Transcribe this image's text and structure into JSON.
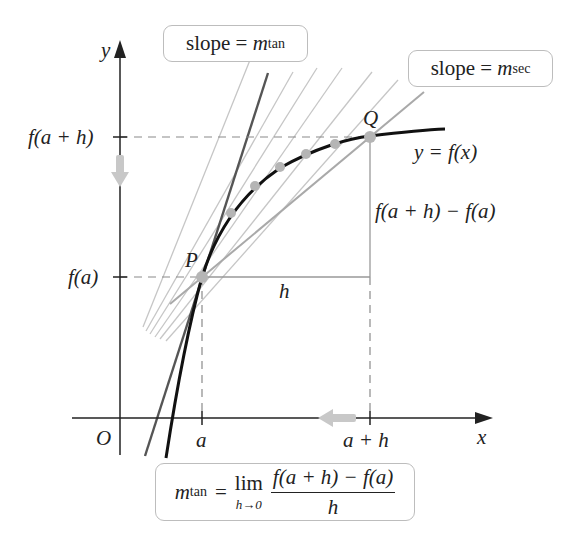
{
  "diagram": {
    "colors": {
      "curve": "#111111",
      "axis": "#222222",
      "tangent_line": "#555555",
      "secant_lines": "#c4c4c4",
      "secant_pq": "#aaaaaa",
      "guide_dashed": "#888888",
      "point_fill": "#b5b5b5",
      "arrow_hint": "#c8c8c8",
      "box_border": "#bdbdbd"
    },
    "axes": {
      "x_label": "x",
      "y_label": "y",
      "origin_label": "O",
      "x_ticks": [
        "a",
        "a + h"
      ],
      "y_ticks": [
        "f(a + h)",
        "f(a)"
      ]
    },
    "points": {
      "P": "P",
      "Q": "Q"
    },
    "curve_label": "y = f(x)",
    "rise_label": "f(a + h) − f(a)",
    "run_label": "h",
    "callouts": {
      "tangent": {
        "prefix": "slope = ",
        "var": "m",
        "sub": "tan"
      },
      "secant": {
        "prefix": "slope = ",
        "var": "m",
        "sub": "sec"
      }
    },
    "formula": {
      "lhs_var": "m",
      "lhs_sub": "tan",
      "equals": "=",
      "lim": "lim",
      "lim_under": "h→0",
      "numerator": "f(a + h) − f(a)",
      "denominator": "h"
    },
    "intermediate_points_count": 5
  }
}
